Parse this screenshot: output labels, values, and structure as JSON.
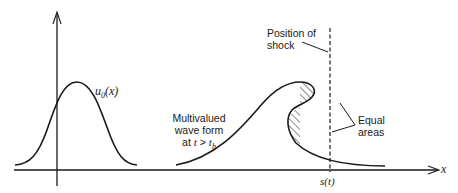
{
  "diagram": {
    "initial_profile_label": "u0(x)",
    "initial_profile_label_base": "u",
    "initial_profile_label_sub": "0",
    "initial_profile_label_arg": "(x)",
    "wave_label_line1": "Multivalued",
    "wave_label_line2": "wave form",
    "wave_label_line3_prefix": "at ",
    "wave_label_line3_t": "t",
    "wave_label_line3_gt": " > ",
    "wave_label_line3_tb": "t",
    "wave_label_line3_sub": "b",
    "shock_label_line1": "Position of",
    "shock_label_line2": "shock",
    "areas_label_line1": "Equal",
    "areas_label_line2": "areas",
    "x_axis_label": "x",
    "shock_position_label": "s(t)",
    "colors": {
      "ink": "#1a1a1a",
      "background": "#ffffff"
    }
  }
}
